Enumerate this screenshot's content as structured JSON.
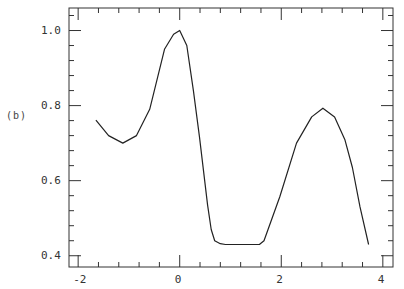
{
  "panel_label": "(b)",
  "colors": {
    "line": "#222222",
    "axis": "#333333",
    "background": "#ffffff"
  },
  "chart_data": {
    "type": "line",
    "title": "",
    "panel": "(b)",
    "xlabel": "",
    "ylabel": "",
    "xlim": [
      -2.18,
      4.2
    ],
    "ylim": [
      0.37,
      1.06
    ],
    "grid": false,
    "legend": null,
    "x_ticks": [
      -2,
      0,
      2,
      4
    ],
    "x_tick_labels": [
      "-2",
      "0",
      "2",
      "4"
    ],
    "x_minor_step": 0.4,
    "y_ticks": [
      0.4,
      0.6,
      0.8,
      1.0
    ],
    "y_tick_labels": [
      "0.4",
      "0.6",
      "0.8",
      "1.0"
    ],
    "y_minor_step": 0.04,
    "series": [
      {
        "name": "curve",
        "x": [
          -1.65,
          -1.4,
          -1.12,
          -0.85,
          -0.59,
          -0.3,
          -0.12,
          0.0,
          0.14,
          0.27,
          0.39,
          0.55,
          0.62,
          0.69,
          0.8,
          0.9,
          1.2,
          1.57,
          1.66,
          1.97,
          2.3,
          2.6,
          2.82,
          3.05,
          3.25,
          3.4,
          3.55,
          3.72
        ],
        "y": [
          0.761,
          0.72,
          0.7,
          0.72,
          0.79,
          0.95,
          0.99,
          1.0,
          0.96,
          0.84,
          0.716,
          0.535,
          0.47,
          0.44,
          0.432,
          0.43,
          0.43,
          0.43,
          0.44,
          0.557,
          0.7,
          0.77,
          0.793,
          0.77,
          0.71,
          0.635,
          0.53,
          0.43
        ]
      }
    ]
  }
}
